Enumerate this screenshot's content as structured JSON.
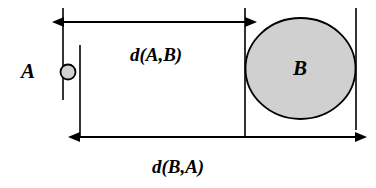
{
  "figure": {
    "name": "directed-distance-diagram",
    "background_color": "#ffffff",
    "stroke_color": "#000000",
    "shape_fill_color": "#d0d0d0",
    "width": 376,
    "height": 188
  },
  "objects": {
    "small": {
      "label": "A",
      "label_x": 28,
      "label_y": 73,
      "shape": "circle",
      "cx": 68,
      "cy": 72,
      "r": 7.5
    },
    "large": {
      "label": "B",
      "label_x": 300,
      "label_y": 70,
      "shape": "ellipse",
      "cx": 300.5,
      "cy": 68.5,
      "rx": 55,
      "ry": 50.5
    }
  },
  "reference_lines": [
    {
      "name": "line-a-near",
      "x": 63,
      "y1": 8,
      "y2": 100
    },
    {
      "name": "line-a-far",
      "x": 80,
      "y1": 45,
      "y2": 136
    },
    {
      "name": "line-b-near",
      "x": 245,
      "y1": 8,
      "y2": 136
    },
    {
      "name": "line-b-far",
      "x": 356,
      "y1": 8,
      "y2": 130
    }
  ],
  "measurements": [
    {
      "name": "distance-a-to-b",
      "label": "d(A,B)",
      "label_x": 156,
      "label_y": 57,
      "axis_y": 22,
      "x_start": 64,
      "x_end": 245
    },
    {
      "name": "distance-b-to-a",
      "label": "d(B,A)",
      "label_x": 178,
      "label_y": 169,
      "axis_y": 137,
      "x_start": 80,
      "x_end": 355
    }
  ]
}
